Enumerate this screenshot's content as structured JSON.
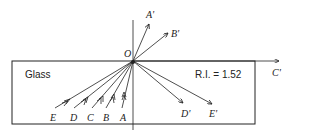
{
  "diagram": {
    "medium_label": "Glass",
    "refractive_index_label": "R.I. = 1.52",
    "origin_label": "O",
    "incident_rays": [
      "E",
      "D",
      "C",
      "B",
      "A"
    ],
    "emergent_rays": [
      "A'",
      "B'",
      "C'",
      "D'",
      "E'"
    ]
  }
}
